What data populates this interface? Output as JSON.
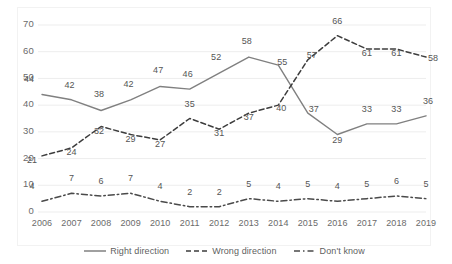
{
  "chart_data": {
    "type": "line",
    "title": "",
    "subtitle": "",
    "xlabel": "",
    "ylabel": "",
    "categories": [
      "2006",
      "2007",
      "2008",
      "2009",
      "2010",
      "2011",
      "2012",
      "2013",
      "2014",
      "2015",
      "2016",
      "2017",
      "2018",
      "2019"
    ],
    "ylim": [
      0,
      70
    ],
    "ytick_step": 10,
    "yticks": [
      "0",
      "10",
      "20",
      "30",
      "40",
      "50",
      "60",
      "70"
    ],
    "grid": "horizontal",
    "legend_position": "bottom",
    "series": [
      {
        "name": "Right direction",
        "style": "solid",
        "color": "#808080",
        "values": [
          44,
          42,
          38,
          42,
          47,
          46,
          52,
          58,
          55,
          37,
          29,
          33,
          33,
          36
        ],
        "labels": [
          "44",
          "42",
          "38",
          "42",
          "47",
          "46",
          "52",
          "58",
          "55",
          "37",
          "29",
          "33",
          "33",
          "36"
        ]
      },
      {
        "name": "Wrong direction",
        "style": "dashed",
        "color": "#3d3d3d",
        "values": [
          21,
          24,
          32,
          29,
          27,
          35,
          31,
          37,
          40,
          57,
          66,
          61,
          61,
          58
        ],
        "labels": [
          "21",
          "24",
          "32",
          "29",
          "27",
          "35",
          "31",
          "37",
          "40",
          "57",
          "66",
          "61",
          "61",
          "58"
        ]
      },
      {
        "name": "Don't know",
        "style": "dash-dot",
        "color": "#4a4a4a",
        "values": [
          4,
          7,
          6,
          7,
          4,
          2,
          2,
          5,
          4,
          5,
          4,
          5,
          6,
          5
        ],
        "labels": [
          "4",
          "7",
          "6",
          "7",
          "4",
          "2",
          "2",
          "5",
          "4",
          "5",
          "4",
          "5",
          "6",
          "5"
        ]
      }
    ]
  },
  "legend": {
    "items": [
      {
        "label": "Right direction"
      },
      {
        "label": "Wrong direction"
      },
      {
        "label": "Don't know"
      }
    ]
  }
}
